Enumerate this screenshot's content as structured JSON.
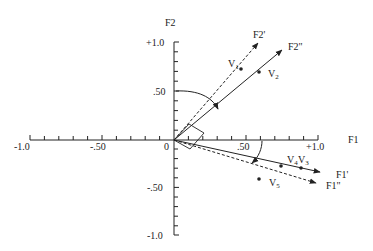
{
  "diagram": {
    "type": "factor rotation plot",
    "axes": {
      "horizontal": {
        "label": "F1",
        "ticks": [
          "-1.0",
          "-.50",
          "0",
          ".50",
          "+1.0"
        ]
      },
      "vertical": {
        "label": "F2",
        "ticks": [
          "+1.0",
          ".50",
          "-.50",
          "-1.0"
        ]
      }
    },
    "rotated_axes": [
      {
        "label": "F2'",
        "style": "dashed"
      },
      {
        "label": "F2\"",
        "style": "solid"
      },
      {
        "label": "F1'",
        "style": "solid"
      },
      {
        "label": "F1\"",
        "style": "dashed"
      }
    ],
    "points": [
      {
        "label": "V",
        "sub": "1"
      },
      {
        "label": "V",
        "sub": "2"
      },
      {
        "label": "V",
        "sub": "3"
      },
      {
        "label": "V",
        "sub": "4"
      },
      {
        "label": "V",
        "sub": "5"
      }
    ]
  },
  "colors": {
    "ink": "#222222",
    "background": "#ffffff"
  }
}
